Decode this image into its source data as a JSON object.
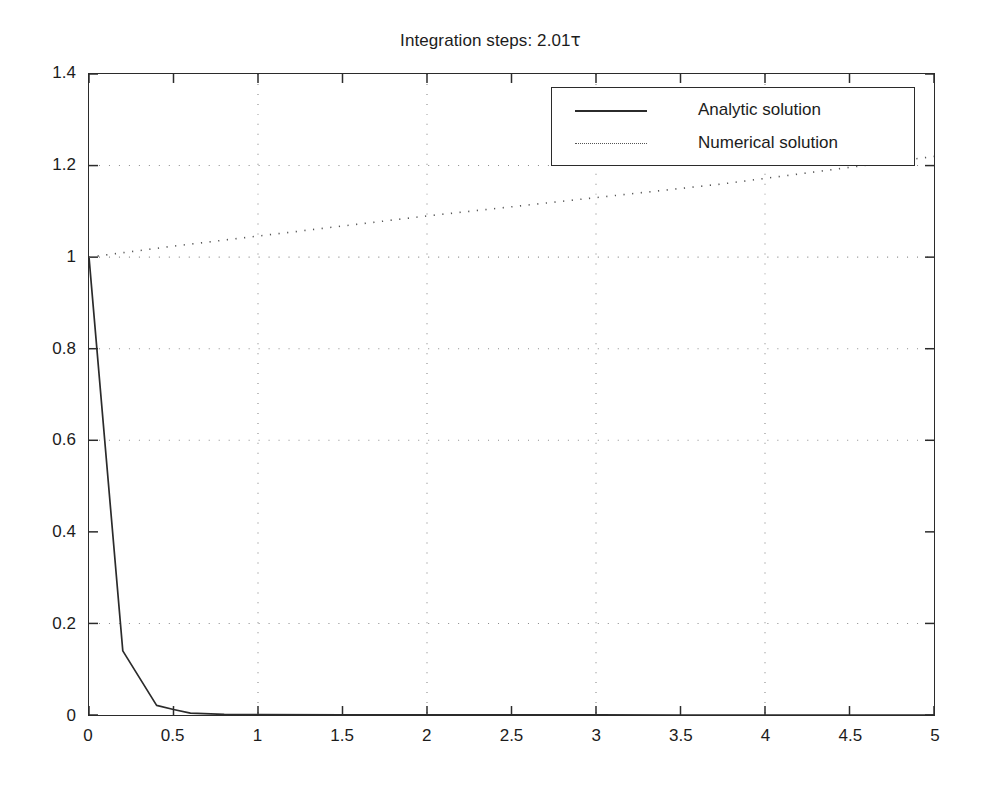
{
  "chart_data": {
    "type": "line",
    "title": "Integration steps: 2.01τ",
    "title_prefix": "Integration steps: 2.01",
    "title_symbol": "τ",
    "xlabel": "",
    "ylabel": "",
    "xlim": [
      0,
      5
    ],
    "ylim": [
      0,
      1.4
    ],
    "grid": true,
    "grid_style": "dotted",
    "x_ticks": [
      0,
      0.5,
      1,
      1.5,
      2,
      2.5,
      3,
      3.5,
      4,
      4.5,
      5
    ],
    "x_tick_labels": [
      "0",
      "0.5",
      "1",
      "1.5",
      "2",
      "2.5",
      "3",
      "3.5",
      "4",
      "4.5",
      "5"
    ],
    "y_ticks": [
      0,
      0.2,
      0.4,
      0.6,
      0.8,
      1,
      1.2,
      1.4
    ],
    "y_tick_labels": [
      "0",
      "0.2",
      "0.4",
      "0.6",
      "0.8",
      "1",
      "1.2",
      "1.4"
    ],
    "x_gridlines": [
      1,
      2,
      3,
      4
    ],
    "y_gridlines": [
      0.2,
      0.6,
      0.8,
      1.0,
      1.2
    ],
    "legend_position": "upper right",
    "series": [
      {
        "name": "Analytic solution",
        "style": "solid",
        "color": "#2b2b2b",
        "x": [
          0,
          0.2,
          0.4,
          0.5,
          0.6,
          0.8,
          1.0,
          1.5,
          2.0,
          2.5,
          3.0,
          3.5,
          4.0,
          4.5,
          5.0
        ],
        "y": [
          1.0,
          0.14,
          0.021,
          0.012,
          0.004,
          0.0015,
          0.0008,
          0.0003,
          0.0002,
          0.0001,
          0.0001,
          0.0,
          0.0,
          0.0,
          0.0
        ]
      },
      {
        "name": "Numerical solution",
        "style": "dotted",
        "color": "#555555",
        "x": [
          0,
          0.25,
          0.5,
          0.75,
          1.0,
          1.25,
          1.5,
          1.75,
          2.0,
          2.25,
          2.5,
          2.75,
          3.0,
          3.25,
          3.5,
          3.75,
          4.0,
          4.25,
          4.5,
          4.75,
          5.0
        ],
        "y": [
          1.0,
          1.012,
          1.024,
          1.035,
          1.046,
          1.057,
          1.068,
          1.079,
          1.09,
          1.1,
          1.11,
          1.12,
          1.13,
          1.14,
          1.15,
          1.16,
          1.172,
          1.184,
          1.196,
          1.208,
          1.22
        ]
      }
    ]
  },
  "legend": {
    "items": [
      {
        "label": "Analytic solution",
        "sample": "solid-line-sample"
      },
      {
        "label": "Numerical solution",
        "sample": "dotted-line-sample"
      }
    ]
  }
}
